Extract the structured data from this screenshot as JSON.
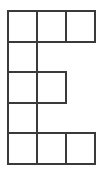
{
  "figure": {
    "name": "letter-e-grid-polyomino",
    "background_color": "#ffffff",
    "stroke_color": "#3a3a3a",
    "cell_fill_color": "#ffffff",
    "stroke_width": 2,
    "canvas": {
      "width": 103,
      "height": 173
    },
    "grid": {
      "columns": 3,
      "rows": 5,
      "origin_x": 8,
      "origin_y": 11,
      "cell_width": 29,
      "cell_height": 30.5,
      "column_x": [
        8,
        37,
        66,
        95
      ],
      "row_y": [
        11,
        41.5,
        72,
        102.5,
        133,
        163.5
      ]
    },
    "cells": [
      {
        "name": "cell-r1c1",
        "row": 0,
        "col": 0
      },
      {
        "name": "cell-r1c2",
        "row": 0,
        "col": 1
      },
      {
        "name": "cell-r1c3",
        "row": 0,
        "col": 2
      },
      {
        "name": "cell-r2c1",
        "row": 1,
        "col": 0
      },
      {
        "name": "cell-r3c1",
        "row": 2,
        "col": 0
      },
      {
        "name": "cell-r3c2",
        "row": 2,
        "col": 1
      },
      {
        "name": "cell-r4c1",
        "row": 3,
        "col": 0
      },
      {
        "name": "cell-r5c1",
        "row": 4,
        "col": 0
      },
      {
        "name": "cell-r5c2",
        "row": 4,
        "col": 1
      },
      {
        "name": "cell-r5c3",
        "row": 4,
        "col": 2
      }
    ]
  }
}
